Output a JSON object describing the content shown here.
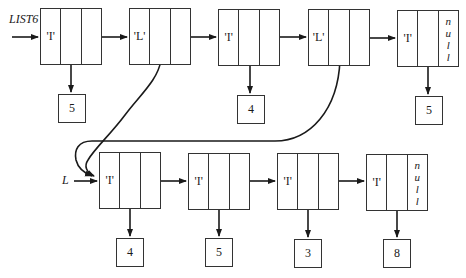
{
  "diagram": {
    "type": "linked-list",
    "colors": {
      "line": "#1a1a1a",
      "background": "#ffffff"
    },
    "lists": [
      {
        "pointer_label": "LIST6",
        "nodes": [
          {
            "tag": "'I'",
            "value": "5",
            "next": ""
          },
          {
            "tag": "'L'",
            "value": "",
            "next": "",
            "sublist_pointer": "L"
          },
          {
            "tag": "'I'",
            "value": "4",
            "next": ""
          },
          {
            "tag": "'L'",
            "value": "",
            "next": "",
            "sublist_pointer": "L"
          },
          {
            "tag": "'I'",
            "value": "5",
            "next": "null"
          }
        ]
      },
      {
        "pointer_label": "L",
        "nodes": [
          {
            "tag": "'I'",
            "value": "4",
            "next": ""
          },
          {
            "tag": "'I'",
            "value": "5",
            "next": ""
          },
          {
            "tag": "'I'",
            "value": "3",
            "next": ""
          },
          {
            "tag": "'I'",
            "value": "8",
            "next": "null"
          }
        ]
      }
    ],
    "null_letters": [
      "n",
      "u",
      "l",
      "l"
    ]
  }
}
